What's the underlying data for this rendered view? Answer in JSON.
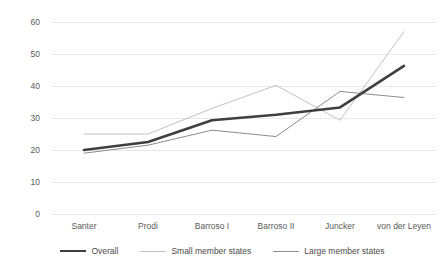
{
  "chart_data": {
    "type": "line",
    "title": "",
    "xlabel": "",
    "ylabel": "",
    "categories": [
      "Santer",
      "Prodi",
      "Barroso I",
      "Barroso II",
      "Juncker",
      "von der Leyen"
    ],
    "series": [
      {
        "name": "Overall",
        "values": [
          20.0,
          22.5,
          29.3,
          31.0,
          33.3,
          46.3
        ],
        "color": "#3f3f3f",
        "width": 2.6
      },
      {
        "name": "Small member states",
        "values": [
          25.0,
          25.0,
          33.0,
          40.2,
          29.3,
          57.0
        ],
        "color": "#c2c2c2",
        "width": 1.0
      },
      {
        "name": "Large member states",
        "values": [
          19.0,
          21.5,
          26.2,
          24.2,
          38.3,
          36.4
        ],
        "color": "#8c8c8c",
        "width": 1.0
      }
    ],
    "ylim": [
      0,
      60
    ],
    "yticks": [
      0,
      10,
      20,
      30,
      40,
      50,
      60
    ],
    "ytick_labels": [
      "0",
      "10",
      "20",
      "30",
      "40",
      "50",
      "60"
    ],
    "grid": true,
    "gridline_color": "#e8e8e8",
    "legend_position": "bottom",
    "background": "#ffffff"
  },
  "legend": {
    "entries": [
      {
        "label": "Overall"
      },
      {
        "label": "Small member states"
      },
      {
        "label": "Large member states"
      }
    ]
  }
}
